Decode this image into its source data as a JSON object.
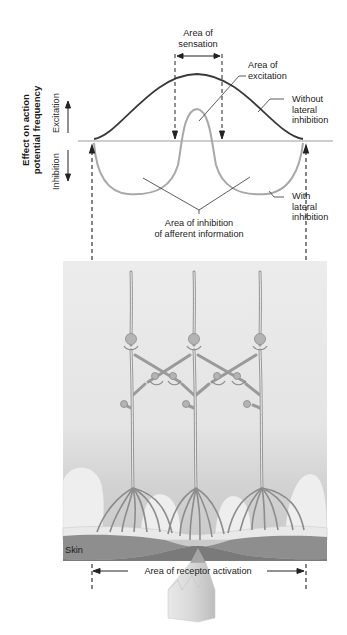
{
  "figure": {
    "y_axis_title_line1": "Effect on action",
    "y_axis_title_line2": "potential frequency",
    "y_axis_up_label": "Excitation",
    "y_axis_down_label": "Inhibition",
    "labels": {
      "area_of_sensation_line1": "Area of",
      "area_of_sensation_line2": "sensation",
      "area_of_excitation_line1": "Area of",
      "area_of_excitation_line2": "excitation",
      "without_lateral_line1": "Without",
      "without_lateral_line2": "lateral",
      "without_lateral_line3": "inhibition",
      "with_lateral_line1": "With",
      "with_lateral_line2": "lateral",
      "with_lateral_line3": "inhibition",
      "area_inhibition_line1": "Area of inhibition",
      "area_inhibition_line2": "of afferent information",
      "skin": "Skin",
      "receptor_activation": "Area of receptor activation"
    },
    "curves": [
      {
        "name": "Without lateral inhibition",
        "color": "#3a3a3a"
      },
      {
        "name": "With lateral inhibition",
        "color": "#a8a8a8"
      }
    ],
    "neurons": 3,
    "colors": {
      "tissue": "#e6e6e6",
      "dermis": "#d6d6d6",
      "skin_band": "#8c8c8c",
      "neuron": "#9a9a9a",
      "stimulus_probe": "#d8d8d8"
    }
  }
}
